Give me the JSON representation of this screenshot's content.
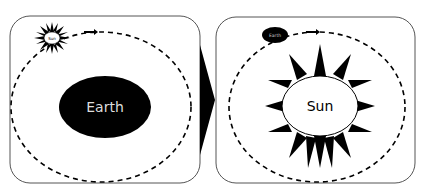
{
  "diagram": {
    "left_panel": {
      "model": "geocentric",
      "center_label": "Earth",
      "orbiting_label": "Sun"
    },
    "right_panel": {
      "model": "heliocentric",
      "center_label": "Sun",
      "orbiting_label": "Earth"
    },
    "transition_arrow": "right",
    "colors": {
      "fill_dark": "#000000",
      "fill_light": "#ffffff",
      "border": "#555555"
    }
  }
}
